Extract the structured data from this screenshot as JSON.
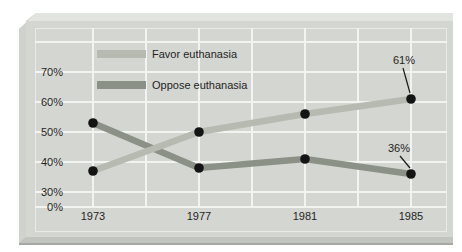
{
  "page": {
    "background": "#ffffff"
  },
  "panel": {
    "face_color": "#d4d6d1",
    "top_bevel_color": "#e2e4df",
    "left_bevel_color": "#d0d2cd",
    "bottom_bevel_color": "#c2c4bf",
    "bottom_shadow_color": "#a6a8a3",
    "inner_frame_color": "#e8eae5",
    "gridline_color": "#f3f4f1"
  },
  "chart_data": {
    "type": "line",
    "title": "",
    "x": [
      1973,
      1977,
      1981,
      1985
    ],
    "x_tick_labels": [
      "1973",
      "1977",
      "1981",
      "1985"
    ],
    "y_axis_tick_labels": [
      "70%",
      "60%",
      "50%",
      "40%",
      "30%",
      "0%"
    ],
    "y_gridline_values": [
      80,
      70,
      60,
      50,
      40,
      30
    ],
    "axis_note": "broken y-axis: 0% baseline shown just below 30%",
    "grid": true,
    "legend_position": "top-left-inside",
    "point_color": "#141414",
    "series": [
      {
        "name": "Favor euthanasia",
        "values": [
          37,
          50,
          56,
          61
        ],
        "color": "#b6bab0",
        "end_label": "61%"
      },
      {
        "name": "Oppose euthanasia",
        "values": [
          53,
          38,
          41,
          36
        ],
        "color": "#8b9186",
        "end_label": "36%"
      }
    ]
  }
}
